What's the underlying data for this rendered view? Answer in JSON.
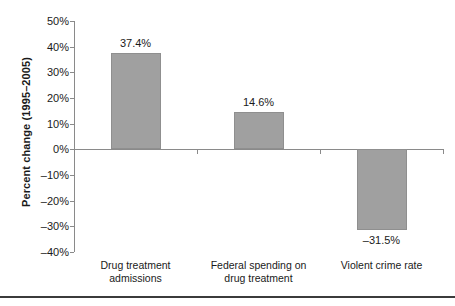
{
  "chart_data": {
    "type": "bar",
    "title": "",
    "subtitle": "",
    "xlabel": "",
    "ylabel": "Percent change (1995–2005)",
    "categories": [
      "Drug treatment admissions",
      "Federal spending on drug treatment",
      "Violent crime rate"
    ],
    "category_lines": [
      [
        "Drug treatment",
        "admissions"
      ],
      [
        "Federal spending on",
        "drug treatment"
      ],
      [
        "Violent crime rate",
        ""
      ]
    ],
    "values": [
      37.4,
      14.6,
      -31.5
    ],
    "data_labels": [
      "37.4%",
      "14.6%",
      "–31.5%"
    ],
    "ylim": [
      -40,
      50
    ],
    "ytick_values": [
      50,
      40,
      30,
      20,
      10,
      0,
      -10,
      -20,
      -30,
      -40
    ],
    "ytick_labels": [
      "50%",
      "40%",
      "30%",
      "20%",
      "10%",
      "0%",
      "–10%",
      "–20%",
      "–30%",
      "–40%"
    ],
    "grid": false,
    "legend": null,
    "bar_color": "#a0a0a0",
    "axis_color": "#8a8a8a",
    "text_color": "#1a1a1a"
  }
}
